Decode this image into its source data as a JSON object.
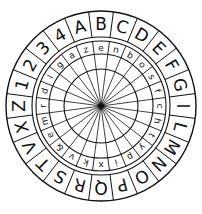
{
  "geometry": {
    "cx": 101,
    "cy": 106,
    "r_outer": 95,
    "r_outer_inner": 69,
    "r_inner_outer": 65,
    "r_inner_inner": 52,
    "r_hub": 37
  },
  "outer_ring": [
    "B",
    "C",
    "D",
    "E",
    "F",
    "G",
    "I",
    "L",
    "M",
    "N",
    "O",
    "P",
    "Q",
    "R",
    "S",
    "T",
    "V",
    "X",
    "Z",
    "1",
    "2",
    "3",
    "4",
    "A"
  ],
  "inner_ring": [
    "e",
    "n",
    "b",
    "o",
    "s",
    "f",
    "c",
    "h",
    "t",
    "y",
    "p",
    "i",
    "x",
    "k",
    "v",
    "&",
    "e",
    "m",
    "r",
    "d",
    "l",
    "g",
    "a",
    "z"
  ],
  "spoke_count": 24,
  "colors": {
    "ink": "#111111",
    "paper": "#ffffff"
  }
}
